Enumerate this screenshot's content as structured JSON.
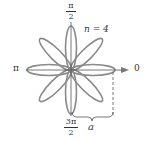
{
  "diagram": {
    "type": "polar-rose",
    "equation_parameter": "n = 4",
    "petal_count": 8,
    "labels": {
      "top_num": "π",
      "top_den": "2",
      "left": "π",
      "right": "0",
      "bottom_num": "3π",
      "bottom_den": "2",
      "n_label": "n = 4",
      "length_label": "a"
    },
    "colors": {
      "curve": "#8a8a8a",
      "axis": "#555555",
      "text": "#333333"
    }
  }
}
